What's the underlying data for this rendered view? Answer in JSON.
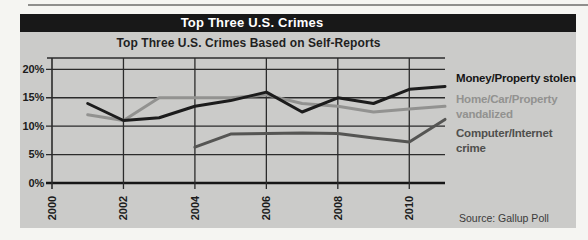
{
  "header": {
    "title": "Top Three U.S. Crimes"
  },
  "chart_data": {
    "type": "line",
    "title": "Top Three U.S. Crimes Based on Self-Reports",
    "xlabel": "",
    "ylabel": "",
    "x_ticks": [
      2000,
      2002,
      2004,
      2006,
      2008,
      2010
    ],
    "x_tick_labels": [
      "2000",
      "2002",
      "2004",
      "2006",
      "2008",
      "2010"
    ],
    "y_ticks": [
      20,
      15,
      10,
      5,
      0
    ],
    "y_tick_labels": [
      "20%",
      "15%",
      "10%",
      "5%",
      "0%"
    ],
    "xlim": [
      2000,
      2011
    ],
    "ylim": [
      0,
      22
    ],
    "grid": true,
    "legend_position": "right",
    "series": [
      {
        "name": "Money/Property stolen",
        "color": "#1c1c1c",
        "points": [
          [
            2001,
            14
          ],
          [
            2002,
            11
          ],
          [
            2003,
            11.5
          ],
          [
            2004,
            13.5
          ],
          [
            2005,
            14.5
          ],
          [
            2006,
            16
          ],
          [
            2007,
            12.5
          ],
          [
            2008,
            15
          ],
          [
            2009,
            14
          ],
          [
            2010,
            16.5
          ],
          [
            2011,
            17
          ]
        ]
      },
      {
        "name": "Home/Car/Property vandalized",
        "color": "#929290",
        "points": [
          [
            2001,
            12
          ],
          [
            2002,
            11
          ],
          [
            2003,
            15
          ],
          [
            2004,
            15
          ],
          [
            2005,
            15
          ],
          [
            2006,
            15.5
          ],
          [
            2007,
            14
          ],
          [
            2008,
            13.5
          ],
          [
            2009,
            12.5
          ],
          [
            2010,
            13
          ],
          [
            2011,
            13.5
          ]
        ]
      },
      {
        "name": "Computer/Internet crime",
        "color": "#555553",
        "points": [
          [
            2004,
            6.3
          ],
          [
            2005,
            8.6
          ],
          [
            2006,
            8.7
          ],
          [
            2007,
            8.8
          ],
          [
            2008,
            8.7
          ],
          [
            2009,
            7.9
          ],
          [
            2010,
            7.2
          ],
          [
            2011,
            11.2
          ]
        ]
      }
    ]
  },
  "legend": {
    "items": [
      {
        "label": "Money/Property stolen",
        "color": "#1c1c1c"
      },
      {
        "label": "Home/Car/Property\nvandalized",
        "color": "#929290"
      },
      {
        "label": "Computer/Internet\ncrime",
        "color": "#555553"
      }
    ]
  },
  "source": "Source: Gallup Poll",
  "colors": {
    "page_bg": "#f5f5f2",
    "panel_bg": "#cbcbc9",
    "title_bar_bg": "#181818",
    "title_bar_text": "#ffffff",
    "grid_line": "#2b2b2b",
    "axis_line": "#161616"
  }
}
